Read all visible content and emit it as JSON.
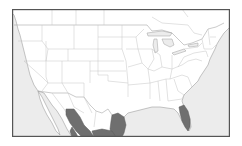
{
  "map": {
    "type": "species-range-map",
    "region": "North America (contiguous United States, southern Canada, northern Mexico)",
    "colors": {
      "background": "#ffffff",
      "land": "#ffffff",
      "water": "#ececec",
      "borders": "#bdbdbd",
      "frame": "#555555",
      "range": "#6f6f6f"
    },
    "range_areas": [
      {
        "name": "western-mexico-sierra-madre-occidental"
      },
      {
        "name": "eastern-mexico-sierra-madre-oriental"
      },
      {
        "name": "central-mexico"
      },
      {
        "name": "florida-peninsula"
      }
    ]
  }
}
